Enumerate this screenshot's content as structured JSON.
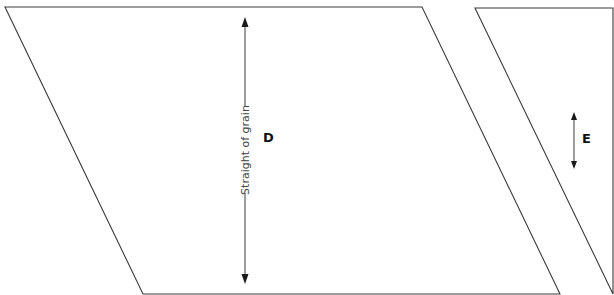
{
  "diagram": {
    "type": "sewing-pattern-pieces",
    "background": "#ffffff",
    "line_color": "#3a3a3a",
    "pieces": [
      {
        "id": "D",
        "label": "D",
        "shape": "parallelogram",
        "points": [
          [
            5,
            7
          ],
          [
            422,
            7
          ],
          [
            560,
            294
          ],
          [
            143,
            294
          ]
        ],
        "grainline": {
          "x": 245,
          "y1": 18,
          "y2": 283,
          "label": "Straight of grain",
          "label_center_y": 150
        },
        "label_pos": [
          269,
          142
        ]
      },
      {
        "id": "E",
        "label": "E",
        "shape": "triangle",
        "points": [
          [
            475,
            8
          ],
          [
            613,
            8
          ],
          [
            613,
            294
          ]
        ],
        "grainline": {
          "x": 574,
          "y1": 113,
          "y2": 168,
          "label": ""
        },
        "label_pos": [
          586,
          143
        ]
      }
    ]
  }
}
